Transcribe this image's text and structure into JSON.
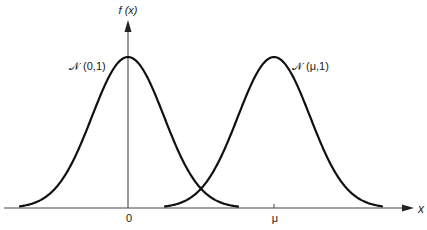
{
  "chart_data": {
    "type": "line",
    "title": "",
    "xlabel": "x",
    "ylabel": "f (x)",
    "grid": false,
    "legend": "none (curves labelled directly)",
    "x_ticks": [
      "0",
      "μ"
    ],
    "y_ticks": [],
    "series": [
      {
        "name": "𝒩(0,1)",
        "label": "𝒩 (0,1)",
        "distribution": "normal",
        "mean": 0,
        "variance": 1,
        "peak_x": "0"
      },
      {
        "name": "𝒩(μ,1)",
        "label": "𝒩 (μ,1)",
        "distribution": "normal",
        "mean": "μ",
        "variance": 1,
        "peak_x": "μ"
      }
    ],
    "annotations": [
      "curves intersect at x = μ/2"
    ]
  },
  "labels": {
    "y_axis": "f (x)",
    "x_axis": "x",
    "tick_zero": "0",
    "tick_mu": "μ",
    "curve_left": "𝒩 (0,1)",
    "curve_right": "𝒩 (μ,1)"
  },
  "colors": {
    "curve": "#111111",
    "axis": "#444444",
    "background": "#ffffff"
  }
}
